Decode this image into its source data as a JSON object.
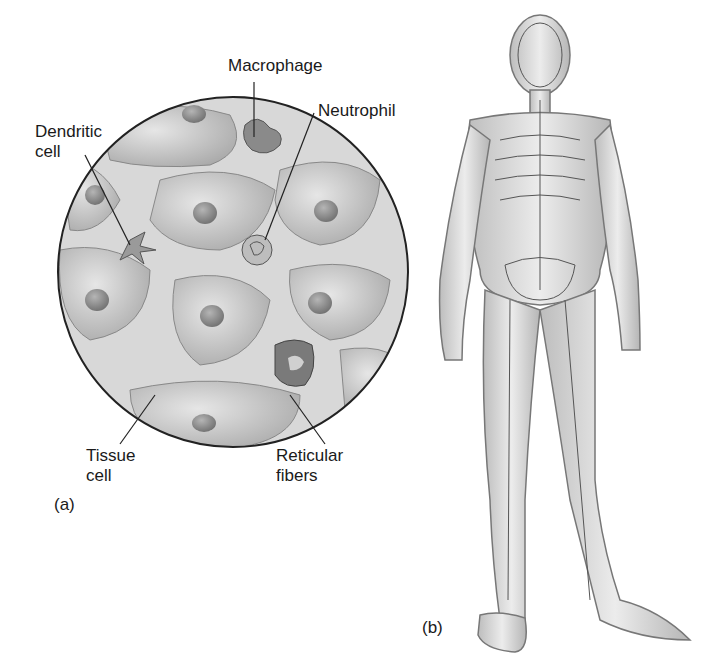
{
  "panel_a": {
    "label": "(a)",
    "callouts": {
      "macrophage": "Macrophage",
      "neutrophil": "Neutrophil",
      "dendritic_line1": "Dendritic",
      "dendritic_line2": "cell",
      "tissue_line1": "Tissue",
      "tissue_line2": "cell",
      "reticular_line1": "Reticular",
      "reticular_line2": "fibers"
    }
  },
  "panel_b": {
    "label": "(b)"
  }
}
